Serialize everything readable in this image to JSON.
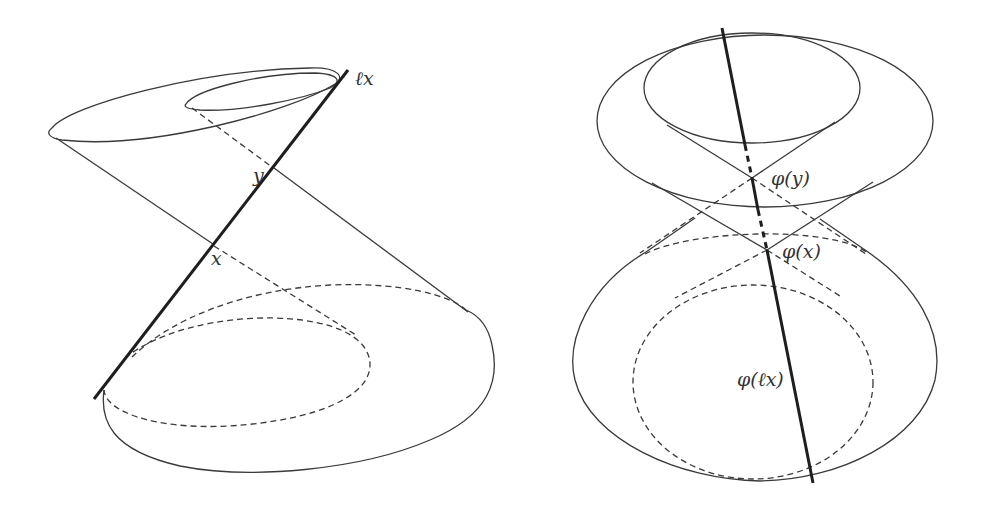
{
  "figures": [
    {
      "name": "left",
      "labels": {
        "line": "ℓx",
        "point_y": "y",
        "point_x": "x"
      }
    },
    {
      "name": "right",
      "labels": {
        "point_y": "φ(y)",
        "point_x": "φ(x)",
        "line": "φ(ℓx)"
      }
    }
  ],
  "colors": {
    "stroke": "#3a3a3a",
    "axis": "#1e1e1e",
    "background": "#ffffff"
  }
}
